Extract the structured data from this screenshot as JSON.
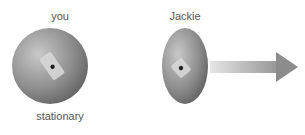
{
  "diagram": {
    "objects": [
      {
        "id": "you",
        "label": "you",
        "state_label": "stationary",
        "shape": "sphere"
      },
      {
        "id": "jackie",
        "label": "Jackie",
        "shape": "flattened-sphere (length-contracted)",
        "motion": "moving right"
      }
    ],
    "arrow": {
      "direction": "right",
      "meaning": "velocity"
    },
    "colors": {
      "sphere": "#8a8a8a",
      "arrow": "#9a9a9a",
      "text": "#555555"
    }
  }
}
